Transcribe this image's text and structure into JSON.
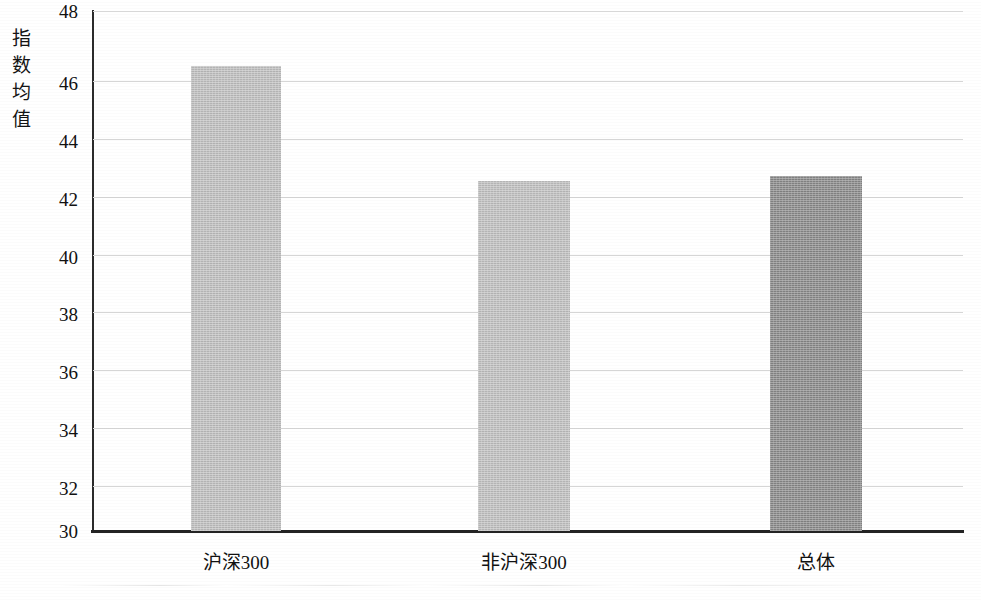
{
  "chart_data": {
    "type": "bar",
    "title": "",
    "xlabel": "",
    "ylabel": "指数均值",
    "ylim": [
      30,
      48
    ],
    "ytick_step": 2,
    "yticks": [
      "48",
      "46",
      "44",
      "42",
      "40",
      "38",
      "36",
      "34",
      "32",
      "30"
    ],
    "grid": true,
    "legend": "none",
    "categories": [
      "沪深300",
      "非沪深300",
      "总体"
    ],
    "values": [
      46.1,
      42.1,
      42.3
    ],
    "bar_colors": [
      "#bdbdbd",
      "#bebebe",
      "#878787"
    ],
    "series": [
      {
        "name": "指数均值",
        "values": [
          46.1,
          42.1,
          42.3
        ]
      }
    ]
  },
  "axes": {
    "y_axis_title": "指数均值",
    "y_axis_title_chars": [
      "指",
      "数",
      "均",
      "值"
    ],
    "y_axis_color": "#2b2b2b",
    "x_axis_color": "#232323",
    "gridline_color": "#d6d6d6"
  }
}
